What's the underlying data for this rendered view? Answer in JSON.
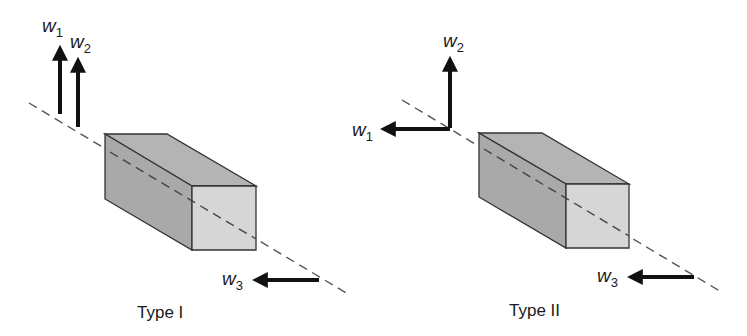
{
  "figures": [
    {
      "caption": "Type I",
      "vectors": [
        {
          "symbol": "w",
          "subscript": "1",
          "direction": "up"
        },
        {
          "symbol": "w",
          "subscript": "2",
          "direction": "up"
        },
        {
          "symbol": "w",
          "subscript": "3",
          "direction": "left"
        }
      ]
    },
    {
      "caption": "Type II",
      "vectors": [
        {
          "symbol": "w",
          "subscript": "1",
          "direction": "left"
        },
        {
          "symbol": "w",
          "subscript": "2",
          "direction": "up"
        },
        {
          "symbol": "w",
          "subscript": "3",
          "direction": "left"
        }
      ]
    }
  ],
  "colors": {
    "box_side": "#a9a9a9",
    "box_top": "#b4b4b4",
    "box_front": "#d6d6d6",
    "edge": "#333333",
    "arrow": "#111111",
    "axis_dash": "#555555"
  }
}
